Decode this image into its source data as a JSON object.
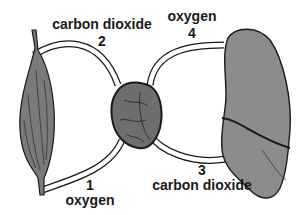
{
  "diagram": {
    "organs": [
      {
        "id": "muscle",
        "name": "muscle"
      },
      {
        "id": "heart",
        "name": "heart"
      },
      {
        "id": "lung",
        "name": "lung"
      }
    ],
    "labels": [
      {
        "id": "label-2",
        "number": "2",
        "text": "carbon dioxide"
      },
      {
        "id": "label-4",
        "number": "4",
        "text": "oxygen"
      },
      {
        "id": "label-1",
        "number": "1",
        "text": "oxygen"
      },
      {
        "id": "label-3",
        "number": "3",
        "text": "carbon dioxide"
      }
    ],
    "colors": {
      "ink": "#1a1a1a",
      "organ_fill": "#7a7a7a",
      "lung_fill": "#8c8c8c",
      "vessel_fill": "#ffffff"
    }
  }
}
